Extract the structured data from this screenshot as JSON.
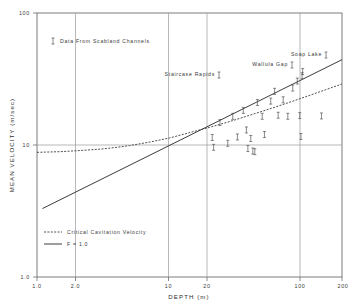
{
  "figure": {
    "background_color": "#ffffff",
    "ink_color": "#3a3a3a",
    "grid_color": "#9a9a9a"
  },
  "chart_data": {
    "type": "scatter",
    "title": "",
    "xlabel": "DEPTH (m)",
    "ylabel": "MEAN VELOCITY (m/sec)",
    "xscale": "log",
    "yscale": "log",
    "xlim": [
      1.0,
      200
    ],
    "ylim": [
      1.0,
      100
    ],
    "grid": true,
    "xticks": [
      1.0,
      2.0,
      10,
      20,
      100,
      200
    ],
    "xticklabels": [
      "1.0",
      "2.0",
      "10",
      "20",
      "100",
      "200"
    ],
    "yticks": [
      1.0,
      10,
      100
    ],
    "yticklabels": [
      "1.0",
      "10",
      "100"
    ],
    "gridlines_x": [
      2.0,
      10,
      20,
      100
    ],
    "gridlines_y": [
      10
    ],
    "legend_position": "lower-left",
    "legend": [
      {
        "label": "Critical Cavitation Velocity",
        "style": "dashed"
      },
      {
        "label": "F = 1.0",
        "style": "solid"
      }
    ],
    "annotations": [
      {
        "text": "Data From Scabland Channels",
        "x": 3.0,
        "y": 46,
        "marker": true
      },
      {
        "text": "Staircase Rapids",
        "x": 22,
        "y": 34,
        "marker": true
      },
      {
        "text": "Wallula Gap",
        "x": 55,
        "y": 40,
        "marker": true
      },
      {
        "text": "Soap Lake",
        "x": 95,
        "y": 47,
        "marker": true
      }
    ],
    "series": [
      {
        "name": "Critical Cavitation Velocity",
        "style": "dashed",
        "x": [
          1.0,
          1.5,
          2.0,
          3.0,
          4.0,
          5.0,
          7.0,
          10,
          15,
          20,
          30,
          50,
          70,
          100,
          150,
          200
        ],
        "y": [
          8.8,
          8.9,
          9.05,
          9.3,
          9.6,
          9.9,
          10.5,
          11.3,
          12.6,
          13.6,
          15.3,
          18.0,
          20.1,
          22.7,
          26.2,
          29.0
        ]
      },
      {
        "name": "F = 1.0",
        "style": "solid",
        "x": [
          1.1,
          200
        ],
        "y": [
          3.3,
          44.3
        ]
      }
    ],
    "data_points": {
      "name": "Data From Scabland Channels",
      "marker": "I-bar",
      "points": [
        {
          "x": 21.0,
          "y": 11.4
        },
        {
          "x": 21.5,
          "y": 9.6
        },
        {
          "x": 24.0,
          "y": 14.8
        },
        {
          "x": 27.5,
          "y": 10.3
        },
        {
          "x": 30.0,
          "y": 16.5
        },
        {
          "x": 32.5,
          "y": 11.5
        },
        {
          "x": 36.0,
          "y": 18.3
        },
        {
          "x": 38.0,
          "y": 13.0
        },
        {
          "x": 39.0,
          "y": 9.4
        },
        {
          "x": 41.0,
          "y": 11.2
        },
        {
          "x": 42.5,
          "y": 9.0
        },
        {
          "x": 44.0,
          "y": 8.9
        },
        {
          "x": 46.0,
          "y": 21.0
        },
        {
          "x": 50.0,
          "y": 16.5
        },
        {
          "x": 52.0,
          "y": 12.0
        },
        {
          "x": 58.0,
          "y": 21.5
        },
        {
          "x": 62.0,
          "y": 25.5
        },
        {
          "x": 66.0,
          "y": 16.8
        },
        {
          "x": 72.0,
          "y": 22.0
        },
        {
          "x": 78.0,
          "y": 16.5
        },
        {
          "x": 85.0,
          "y": 27.0
        },
        {
          "x": 92.0,
          "y": 30.5
        },
        {
          "x": 96.0,
          "y": 16.7
        },
        {
          "x": 98.0,
          "y": 11.6
        },
        {
          "x": 100.0,
          "y": 33.5
        },
        {
          "x": 101.0,
          "y": 36.0
        },
        {
          "x": 140.0,
          "y": 16.6
        }
      ]
    }
  }
}
